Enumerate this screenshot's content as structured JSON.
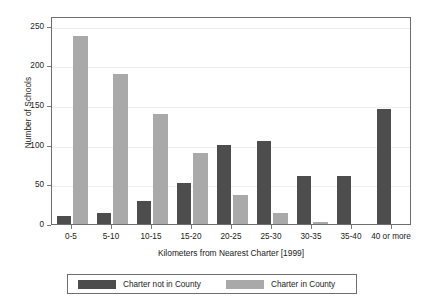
{
  "chart_data": {
    "type": "bar",
    "title": "",
    "xlabel": "Kilometers from Nearest Charter [1999]",
    "ylabel": "Number of Schools",
    "categories": [
      "0-5",
      "5-10",
      "10-15",
      "15-20",
      "20-25",
      "25-30",
      "30-35",
      "35-40",
      "40 or more"
    ],
    "series": [
      {
        "name": "Charter not in County",
        "color": "#4d4d4d",
        "values": [
          10,
          14,
          29,
          52,
          99,
          104,
          60,
          61,
          145
        ]
      },
      {
        "name": "Charter in County",
        "color": "#a9a9a9",
        "values": [
          237,
          189,
          138,
          89,
          37,
          14,
          2,
          0,
          0
        ]
      }
    ],
    "ylim": [
      0,
      262
    ],
    "yticks": [
      0,
      50,
      100,
      150,
      200,
      250
    ],
    "ytick_labels": [
      "0",
      "50",
      "100",
      "150",
      "200",
      "250"
    ],
    "grid": true,
    "legend_position": "bottom"
  },
  "legend": {
    "entries": [
      {
        "label": "Charter not in County",
        "swatch": "dark"
      },
      {
        "label": "Charter in County",
        "swatch": "light"
      }
    ]
  }
}
